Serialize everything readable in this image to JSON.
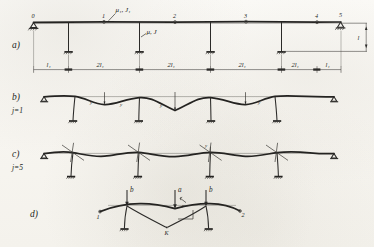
{
  "figure": {
    "kind": "hand-drawn structural engineering diagram",
    "medium": "scanned pencil drawing on paper",
    "ink_color": "#2b2a28",
    "paper_color": "#f7f5f0"
  },
  "panels": [
    {
      "id": "a",
      "label": "a)",
      "caption": "",
      "description": "five-span continuous frame on columns, structural scheme"
    },
    {
      "id": "b",
      "label": "b)",
      "caption": "j=1",
      "description": "first buckling mode deflected shape"
    },
    {
      "id": "c",
      "label": "c)",
      "caption": "j=5",
      "description": "fifth buckling mode deflected shape"
    },
    {
      "id": "d",
      "label": "d)",
      "caption": "",
      "description": "loading detail, two-span segment with point loads"
    }
  ],
  "scheme": {
    "node_numbers": [
      "0",
      "1",
      "2",
      "3",
      "4",
      "5"
    ],
    "stiffness_top": "μ₁, J₁",
    "stiffness_column": "μ, J",
    "span_dimensions": [
      "l₁",
      "2l₁",
      "2l₁",
      "2l₁",
      "2l₁",
      "l₁"
    ],
    "height_dimension": "l",
    "support_left": "pin",
    "support_right": "pin",
    "column_base": "fixed"
  },
  "modes": {
    "mode_b": "j=1",
    "mode_c": "j=5",
    "b_amplitude_marks": [
      "y",
      "y",
      "y",
      "y"
    ],
    "c_amplitude_marks": [
      "y"
    ]
  },
  "detail_d": {
    "loads": [
      "b",
      "a",
      "b"
    ],
    "node_left": "1",
    "node_right": "2",
    "vertex_label": "K",
    "angle_label": "y"
  }
}
